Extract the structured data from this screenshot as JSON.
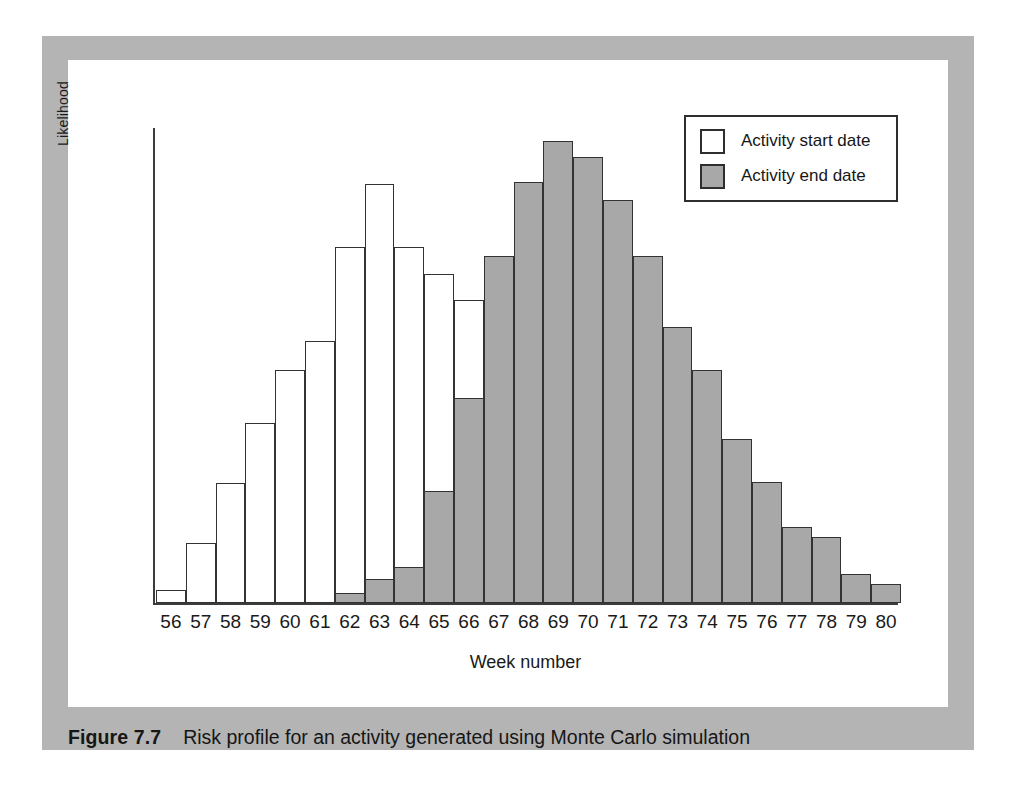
{
  "figure": {
    "label": "Figure 7.7",
    "caption": "Risk profile for an activity generated using Monte Carlo simulation"
  },
  "legend": {
    "position": "top-right",
    "items": [
      {
        "label": "Activity start date",
        "swatch": "white"
      },
      {
        "label": "Activity end date",
        "swatch": "grey"
      }
    ]
  },
  "colors": {
    "mount": "#b4b4b4",
    "plate": "#ffffff",
    "bar_start_fill": "#ffffff",
    "bar_end_fill": "#a8a8a8",
    "bar_stroke": "#333333",
    "axis": "#3c3c3c",
    "text": "#1a1a1a"
  },
  "chart_data": {
    "type": "bar",
    "title": "",
    "subtitle": "",
    "xlabel": "Week number",
    "ylabel": "Likelihood",
    "grid": false,
    "legend_position": "top-right",
    "ylim": [
      0,
      520
    ],
    "axis_ticks_y": [],
    "categories": [
      "56",
      "57",
      "58",
      "59",
      "60",
      "61",
      "62",
      "63",
      "64",
      "65",
      "66",
      "67",
      "68",
      "69",
      "70",
      "71",
      "72",
      "73",
      "74",
      "75",
      "76",
      "77",
      "78",
      "79",
      "80"
    ],
    "series": [
      {
        "name": "Activity start date",
        "fill": "#ffffff",
        "values": [
          14,
          64,
          129,
          193,
          250,
          281,
          382,
          449,
          382,
          353,
          325,
          0,
          0,
          0,
          0,
          0,
          0,
          0,
          0,
          0,
          0,
          0,
          0,
          0,
          0
        ]
      },
      {
        "name": "Activity end date",
        "fill": "#a8a8a8",
        "values": [
          0,
          0,
          0,
          0,
          0,
          0,
          11,
          26,
          39,
          120,
          220,
          372,
          451,
          495,
          478,
          432,
          372,
          296,
          250,
          176,
          130,
          81,
          71,
          31,
          20
        ]
      }
    ]
  }
}
